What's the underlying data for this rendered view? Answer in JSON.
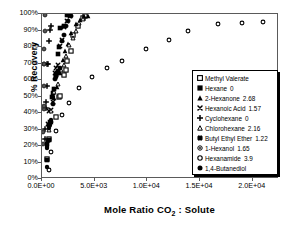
{
  "chart_data": {
    "type": "scatter",
    "title": "",
    "xlabel": "Mole Ratio CO2 : Solute",
    "xlabel_rich": {
      "pre": "Mole Ratio CO",
      "sub": "2",
      "post": " : Solute"
    },
    "ylabel": "% Recovery",
    "xlim": [
      0,
      22500
    ],
    "ylim": [
      0,
      1.0
    ],
    "xticks": [
      0,
      5000,
      10000,
      15000,
      20000
    ],
    "xtick_labels": [
      "0.0E+00",
      "5.0E+03",
      "1.0E+04",
      "1.5E+04",
      "2.0E+04"
    ],
    "yticks": [
      0,
      0.1,
      0.2,
      0.3,
      0.4,
      0.5,
      0.6,
      0.7,
      0.8,
      0.9,
      1.0
    ],
    "ytick_labels": [
      "0%",
      "10%",
      "20%",
      "30%",
      "40%",
      "50%",
      "60%",
      "70%",
      "80%",
      "90%",
      "100%"
    ],
    "grid": false,
    "legend_position": "lower-right",
    "series": [
      {
        "name": "Methyl Valerate",
        "value_label": "",
        "marker": "open-square",
        "points": [
          [
            430,
            0.12
          ],
          [
            700,
            0.24
          ],
          [
            1300,
            0.375
          ],
          [
            1600,
            0.5
          ],
          [
            1750,
            0.505
          ],
          [
            2100,
            0.63
          ],
          [
            2250,
            0.66
          ],
          [
            2400,
            0.715
          ],
          [
            2750,
            0.775
          ],
          [
            2900,
            0.87
          ],
          [
            3450,
            0.93
          ],
          [
            3900,
            0.975
          ],
          [
            4100,
            0.985
          ]
        ]
      },
      {
        "name": "Hexane",
        "value_label": "0",
        "marker": "filled-square",
        "points": [
          [
            450,
            0.115
          ],
          [
            520,
            0.215
          ],
          [
            620,
            0.235
          ],
          [
            700,
            0.33
          ],
          [
            800,
            0.345
          ],
          [
            950,
            0.5
          ],
          [
            1050,
            0.52
          ],
          [
            1150,
            0.545
          ],
          [
            1300,
            0.63
          ],
          [
            1400,
            0.645
          ],
          [
            1500,
            0.755
          ],
          [
            1650,
            0.8
          ],
          [
            1750,
            0.915
          ],
          [
            2050,
            0.93
          ],
          [
            2350,
            0.995
          ],
          [
            2500,
            0.998
          ]
        ]
      },
      {
        "name": "2-Hexanone",
        "value_label": "2.68",
        "marker": "filled-triangle",
        "points": [
          [
            900,
            0.345
          ],
          [
            1100,
            0.49
          ],
          [
            1400,
            0.555
          ],
          [
            1700,
            0.645
          ],
          [
            1950,
            0.72
          ],
          [
            2200,
            0.775
          ],
          [
            2500,
            0.82
          ],
          [
            2800,
            0.885
          ],
          [
            3200,
            0.94
          ],
          [
            3600,
            0.965
          ],
          [
            4000,
            0.985
          ],
          [
            4350,
            0.99
          ]
        ]
      },
      {
        "name": "Hexanoic Acid",
        "value_label": "1.57",
        "marker": "x-cross",
        "points": [
          [
            600,
            0.335
          ],
          [
            700,
            0.415
          ],
          [
            900,
            0.42
          ],
          [
            1050,
            0.465
          ],
          [
            1200,
            0.64
          ],
          [
            1350,
            0.675
          ],
          [
            1500,
            0.69
          ],
          [
            1700,
            0.805
          ],
          [
            1900,
            0.845
          ],
          [
            2100,
            0.92
          ],
          [
            2400,
            0.955
          ],
          [
            2700,
            0.985
          ]
        ]
      },
      {
        "name": "Cyclohexane",
        "value_label": "0",
        "marker": "plus",
        "points": [
          [
            300,
            0.245
          ],
          [
            330,
            0.305
          ],
          [
            380,
            0.43
          ],
          [
            420,
            0.465
          ],
          [
            470,
            0.565
          ],
          [
            520,
            0.695
          ],
          [
            560,
            0.7
          ],
          [
            640,
            0.835
          ],
          [
            760,
            0.905
          ],
          [
            900,
            0.925
          ]
        ]
      },
      {
        "name": "Chlorohexane",
        "value_label": "2.16",
        "marker": "open-triangle",
        "points": [
          [
            700,
            0.3
          ],
          [
            900,
            0.41
          ],
          [
            1150,
            0.53
          ],
          [
            1500,
            0.575
          ],
          [
            1800,
            0.66
          ],
          [
            2050,
            0.69
          ],
          [
            2300,
            0.745
          ],
          [
            2600,
            0.81
          ],
          [
            2900,
            0.855
          ],
          [
            3200,
            0.9
          ],
          [
            3550,
            0.945
          ],
          [
            3900,
            0.97
          ]
        ]
      },
      {
        "name": "Butyl Ethyl Ether",
        "value_label": "1.22",
        "marker": "bold-x",
        "points": [
          [
            850,
            0.345
          ],
          [
            1000,
            0.455
          ],
          [
            1200,
            0.605
          ],
          [
            1350,
            0.625
          ],
          [
            1500,
            0.655
          ],
          [
            1700,
            0.675
          ],
          [
            1900,
            0.835
          ],
          [
            2050,
            0.87
          ],
          [
            2250,
            0.925
          ],
          [
            2500,
            0.955
          ],
          [
            2800,
            0.99
          ]
        ]
      },
      {
        "name": "1-Hexanol",
        "value_label": "1.65",
        "marker": "dotted-circle",
        "points": [
          [
            120,
            0.215
          ],
          [
            130,
            0.285
          ],
          [
            150,
            0.425
          ],
          [
            165,
            0.445
          ],
          [
            180,
            0.565
          ],
          [
            200,
            0.695
          ],
          [
            215,
            0.7
          ],
          [
            230,
            0.79
          ],
          [
            250,
            0.895
          ],
          [
            280,
            0.995
          ]
        ]
      },
      {
        "name": "Hexanamide",
        "value_label": "3.9",
        "marker": "open-circle",
        "points": [
          [
            700,
            0.055
          ],
          [
            900,
            0.165
          ],
          [
            1300,
            0.29
          ],
          [
            1900,
            0.385
          ],
          [
            2600,
            0.46
          ],
          [
            3500,
            0.55
          ],
          [
            4700,
            0.62
          ],
          [
            6200,
            0.67
          ],
          [
            7600,
            0.715
          ],
          [
            9900,
            0.785
          ],
          [
            12100,
            0.845
          ],
          [
            13900,
            0.9
          ],
          [
            16700,
            0.94
          ],
          [
            19000,
            0.945
          ],
          [
            21000,
            0.95
          ]
        ]
      },
      {
        "name": "1,4-Butanediol",
        "value_label": "",
        "marker": "filled-circle",
        "points": [
          [
            430,
            0.075
          ],
          [
            470,
            0.185
          ],
          [
            520,
            0.195
          ],
          [
            600,
            0.23
          ],
          [
            680,
            0.31
          ],
          [
            760,
            0.325
          ],
          [
            850,
            0.36
          ],
          [
            1000,
            0.5
          ],
          [
            1150,
            0.545
          ],
          [
            1300,
            0.62
          ],
          [
            1450,
            0.645
          ]
        ]
      }
    ]
  }
}
